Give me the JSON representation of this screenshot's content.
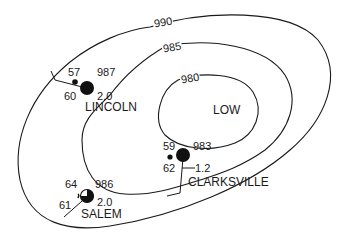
{
  "map": {
    "center_label": "LOW",
    "isobars": [
      {
        "value": "990",
        "unit": "mb"
      },
      {
        "value": "985",
        "unit": "mb"
      },
      {
        "value": "980",
        "unit": "mb"
      }
    ],
    "stations": [
      {
        "name": "LINCOLN",
        "temperature": "57",
        "pressure": "987",
        "dew_point": "60",
        "pressure_change": "2.0",
        "sky_cover": "overcast",
        "weather_symbol": "rain-dot"
      },
      {
        "name": "CLARKSVILLE",
        "temperature": "59",
        "pressure": "983",
        "dew_point": "62",
        "pressure_change": "1.2",
        "sky_cover": "overcast",
        "weather_symbol": "rain-dot"
      },
      {
        "name": "SALEM",
        "temperature": "64",
        "pressure": "986",
        "dew_point": "61",
        "pressure_change": "2.0",
        "sky_cover": "three-quarters covered",
        "weather_symbol": "drizzle-comma"
      }
    ],
    "colors": {
      "line": "#1a1a1a",
      "background": "#ffffff"
    }
  }
}
